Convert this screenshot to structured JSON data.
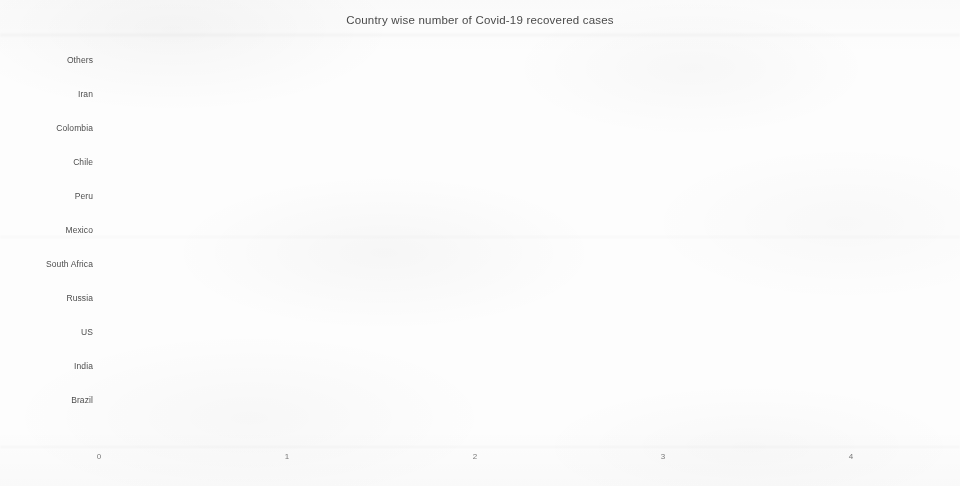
{
  "chart_data": {
    "type": "bar",
    "orientation": "horizontal",
    "title": "Country wise number of Covid-19 recovered cases",
    "xlabel": "",
    "ylabel": "",
    "categories": [
      "Others",
      "Iran",
      "Colombia",
      "Chile",
      "Peru",
      "Mexico",
      "South Africa",
      "Russia",
      "US",
      "India",
      "Brazil"
    ],
    "values": [
      4.37,
      0.3,
      0.3,
      0.37,
      0.37,
      0.44,
      0.48,
      0.74,
      1.88,
      1.98,
      2.71
    ],
    "xlim": [
      0,
      4.6
    ],
    "xticks": [
      0,
      1,
      2,
      3,
      4
    ],
    "xtick_labels": [
      "0",
      "1",
      "2",
      "3",
      "4"
    ],
    "grid": false,
    "legend": null,
    "bar_color": "#3f3f3f"
  }
}
